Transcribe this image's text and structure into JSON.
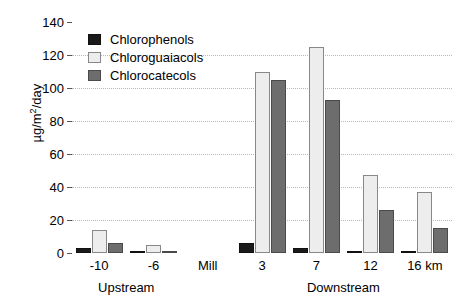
{
  "chart_data": {
    "type": "bar",
    "title": "",
    "xlabel": "",
    "ylabel": "µg/m²/day",
    "ylabel_base": "µg/m",
    "ylabel_sup": "2",
    "ylabel_tail": "/day",
    "ylim": [
      0,
      140
    ],
    "ytick_values": [
      0,
      20,
      40,
      60,
      80,
      100,
      120,
      140
    ],
    "ytick_labels": [
      "0",
      "20",
      "40",
      "60",
      "80",
      "100",
      "120",
      "140"
    ],
    "grid": true,
    "grid_axis": "y",
    "legend_position": "upper-left-inside",
    "categories": [
      "-10",
      "-6",
      "Mill",
      "3",
      "7",
      "12",
      "16 km"
    ],
    "series": [
      {
        "name": "Chlorophenols",
        "color": "#1a1a1a",
        "values": [
          3,
          1,
          0,
          6,
          3,
          1.5,
          1
        ]
      },
      {
        "name": "Chloroguaiacols",
        "color": "#ededed",
        "values": [
          14,
          5,
          0,
          110,
          125,
          47,
          37
        ]
      },
      {
        "name": "Chlorocatecols",
        "color": "#6d6d6d",
        "values": [
          6,
          1.5,
          0,
          105,
          93,
          26,
          15
        ]
      }
    ],
    "group_labels": [
      {
        "text": "Upstream",
        "categories": [
          "-10",
          "-6"
        ]
      },
      {
        "text": "Downstream",
        "categories": [
          "3",
          "7",
          "12",
          "16 km"
        ]
      }
    ]
  },
  "legend": {
    "items": [
      {
        "label": "Chlorophenols",
        "swatch": "phenol"
      },
      {
        "label": "Chloroguaiacols",
        "swatch": "guaiacol"
      },
      {
        "label": "Chlorocatecols",
        "swatch": "catecol"
      }
    ]
  }
}
